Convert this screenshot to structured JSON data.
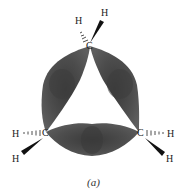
{
  "figure": {
    "caption": "(a)",
    "atoms": {
      "carbon_label": "C",
      "hydrogen_label": "H"
    },
    "colors": {
      "lobe": "#4a4a4a",
      "lobe_dark": "#2e2e2e",
      "lobe_light": "#6a6a6a",
      "bond": "#111111"
    }
  }
}
